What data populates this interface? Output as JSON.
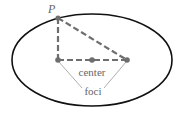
{
  "diagram": {
    "labels": {
      "point": "P",
      "center": "center",
      "foci": "foci"
    },
    "colors": {
      "ellipse": "#111111",
      "construction": "#6e6e6e",
      "leader": "#999999",
      "text": "#666666"
    },
    "geometry": {
      "ellipse": {
        "cx": 92,
        "cy": 60,
        "rx": 80,
        "ry": 46
      },
      "point_P": {
        "x": 58,
        "y": 18
      },
      "focus_left": {
        "x": 58,
        "y": 60
      },
      "focus_right": {
        "x": 127,
        "y": 60
      },
      "center": {
        "x": 92,
        "y": 60
      }
    }
  }
}
